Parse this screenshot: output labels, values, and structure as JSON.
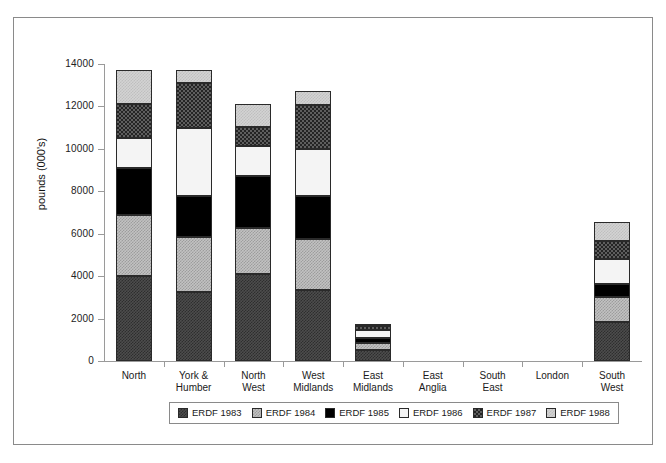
{
  "chart_data": {
    "type": "bar",
    "subtype": "stacked-vertical",
    "title": "",
    "xlabel": "",
    "ylabel": "pounds (000's)",
    "ylim": [
      0,
      14000
    ],
    "ytick_step": 2000,
    "ytick_labels": [
      "14000",
      "12000",
      "10000",
      "8000",
      "6000",
      "4000",
      "2000",
      "0"
    ],
    "ytick_values": [
      14000,
      12000,
      10000,
      8000,
      6000,
      4000,
      2000,
      0
    ],
    "grid": false,
    "legend_position": "bottom-center",
    "categories": [
      "North",
      "York &\nHumber",
      "North\nWest",
      "West\nMidlands",
      "East\nMidlands",
      "East\nAnglia",
      "South\nEast",
      "London",
      "South\nWest"
    ],
    "series": [
      {
        "name": "ERDF 1983",
        "color": "#3d3d3d",
        "values": [
          4000,
          3250,
          4100,
          3350,
          500,
          0,
          0,
          0,
          1850
        ]
      },
      {
        "name": "ERDF 1984",
        "color": "#c2c2c2",
        "values": [
          2900,
          2600,
          2150,
          2400,
          350,
          0,
          0,
          0,
          1150
        ]
      },
      {
        "name": "ERDF 1985",
        "color": "#000000",
        "values": [
          2200,
          1950,
          2450,
          2050,
          250,
          0,
          0,
          0,
          650
        ]
      },
      {
        "name": "ERDF 1986",
        "color": "#f4f4f4",
        "values": [
          1400,
          3200,
          1450,
          2200,
          350,
          0,
          0,
          0,
          1150
        ]
      },
      {
        "name": "ERDF 1987",
        "color": "#4a4a4a",
        "values": [
          1600,
          2100,
          900,
          2050,
          200,
          0,
          0,
          0,
          850
        ]
      },
      {
        "name": "ERDF 1988",
        "color": "#d3d3d3",
        "values": [
          1600,
          600,
          1050,
          700,
          100,
          0,
          0,
          0,
          900
        ]
      }
    ],
    "totals": [
      13700,
      13700,
      12100,
      12750,
      1750,
      0,
      0,
      0,
      6550
    ]
  },
  "legend": {
    "items": [
      {
        "label": "ERDF 1983"
      },
      {
        "label": "ERDF 1984"
      },
      {
        "label": "ERDF 1985"
      },
      {
        "label": "ERDF 1986"
      },
      {
        "label": "ERDF 1987"
      },
      {
        "label": "ERDF 1988"
      }
    ]
  }
}
